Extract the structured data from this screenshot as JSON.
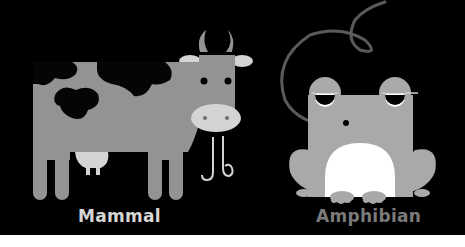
{
  "labels": {
    "mammal": "Mammal",
    "amphibian": "Amphibian"
  },
  "illustrations": {
    "left": "cow",
    "right": "frog"
  },
  "colors": {
    "background": "#000000",
    "bottom_strip": "#ffffff",
    "cow_body": "#939393",
    "cow_spots": "#050505",
    "cow_light": "#d4d4d4",
    "frog_body": "#a9a9a9",
    "frog_belly": "#ffffff",
    "tongue": "#5a5a5a",
    "mammal_label": "#d6d6d6",
    "amphibian_label": "#7a7a7a"
  }
}
